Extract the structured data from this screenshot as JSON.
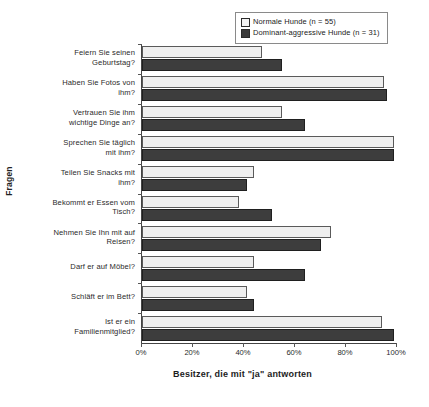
{
  "chart_data": {
    "type": "bar",
    "orientation": "horizontal",
    "title": "",
    "xlabel": "Besitzer, die mit \"ja\" antworten",
    "ylabel": "Fragen",
    "xlim": [
      0,
      100
    ],
    "xticks": [
      "0%",
      "20%",
      "40%",
      "60%",
      "80%",
      "100%"
    ],
    "xtick_values": [
      0,
      20,
      40,
      60,
      80,
      100
    ],
    "grid": false,
    "legend_position": "top-right",
    "categories": [
      "Feiern Sie seinen Geburtstag?",
      "Haben Sie Fotos von ihm?",
      "Vertrauen Sie ihm wichtige Dinge an?",
      "Sprechen Sie täglich mit ihm?",
      "Teilen Sie Snacks mit ihm?",
      "Bekommt er Essen vom Tisch?",
      "Nehmen Sie ihn mit auf Reisen?",
      "Darf er auf Möbel?",
      "Schläft er im Bett?",
      "Ist er ein Familienmitglied?"
    ],
    "series": [
      {
        "name": "Normale Hunde (n = 55)",
        "color": "#efefef",
        "values": [
          47,
          95,
          55,
          99,
          44,
          38,
          74,
          44,
          41,
          94
        ]
      },
      {
        "name": "Dominant-aggressive Hunde (n = 31)",
        "color": "#3d3d3d",
        "values": [
          55,
          96,
          64,
          99,
          41,
          51,
          70,
          64,
          44,
          99
        ]
      }
    ]
  },
  "legend": {
    "items": [
      {
        "label": "Normale Hunde (n = 55)",
        "swatch": "light"
      },
      {
        "label": "Dominant-aggressive Hunde (n = 31)",
        "swatch": "dark"
      }
    ]
  },
  "axes": {
    "y_title": "Fragen",
    "x_title": "Besitzer, die mit \"ja\" antworten"
  },
  "category_lines": [
    [
      "Feiern Sie seinen",
      "Geburtstag?"
    ],
    [
      "Haben Sie Fotos von",
      "ihm?"
    ],
    [
      "Vertrauen Sie ihm",
      "wichtige Dinge an?"
    ],
    [
      "Sprechen Sie täglich",
      "mit ihm?"
    ],
    [
      "Teilen Sie Snacks mit",
      "ihm?"
    ],
    [
      "Bekommt er Essen vom",
      "Tisch?"
    ],
    [
      "Nehmen Sie Ihn mit auf",
      "Reisen?"
    ],
    [
      "Darf er auf Möbel?"
    ],
    [
      "Schläft er im Bett?"
    ],
    [
      "Ist er ein",
      "Familienmitglied?"
    ]
  ]
}
